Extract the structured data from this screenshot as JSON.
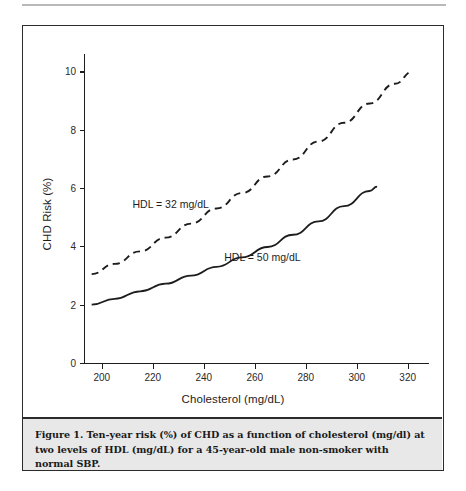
{
  "figure": {
    "caption": "Figure 1. Ten-year risk (%) of CHD as a function of cholesterol (mg/dl) at two levels of HDL (mg/dL) for a 45-year-old male non-smoker with normal SBP.",
    "frame_color": "#2b2b2b",
    "caption_background": "#e8e8e8"
  },
  "chart_data": {
    "type": "line",
    "title": "",
    "xlabel": "Cholesterol (mg/dL)",
    "ylabel": "CHD Risk (%)",
    "xlim": [
      193,
      326
    ],
    "ylim": [
      0,
      10.6
    ],
    "xticks": [
      200,
      220,
      240,
      260,
      280,
      300,
      320
    ],
    "xticklabels": [
      "200",
      "220",
      "240",
      "260",
      "280",
      "300",
      "320"
    ],
    "yticks": [
      0,
      2,
      4,
      6,
      8,
      10
    ],
    "yticklabels": [
      "0",
      "2",
      "4",
      "6",
      "8",
      "10"
    ],
    "grid": false,
    "legend": "inline-annotations",
    "series": [
      {
        "name": "HDL = 32 mg/dL",
        "style": "dashed",
        "color": "#1d1d1d",
        "annotation": "HDL = 32 mg/dL",
        "annotation_x": 227,
        "annotation_y": 5.45,
        "x": [
          196,
          205,
          215,
          225,
          235,
          245,
          255,
          265,
          275,
          285,
          295,
          305,
          315,
          322
        ],
        "y": [
          3.05,
          3.4,
          3.83,
          4.3,
          4.78,
          5.3,
          5.83,
          6.4,
          6.98,
          7.6,
          8.24,
          8.9,
          9.58,
          10.0
        ]
      },
      {
        "name": "HDL = 50 mg/dL",
        "style": "solid",
        "color": "#1d1d1d",
        "annotation": "HDL = 50 mg/dL",
        "annotation_x": 263,
        "annotation_y": 3.62,
        "x": [
          196,
          205,
          215,
          225,
          235,
          245,
          255,
          265,
          275,
          285,
          295,
          305,
          308
        ],
        "y": [
          2.0,
          2.2,
          2.46,
          2.72,
          3.0,
          3.3,
          3.62,
          3.98,
          4.4,
          4.86,
          5.38,
          5.9,
          6.05
        ]
      }
    ]
  }
}
